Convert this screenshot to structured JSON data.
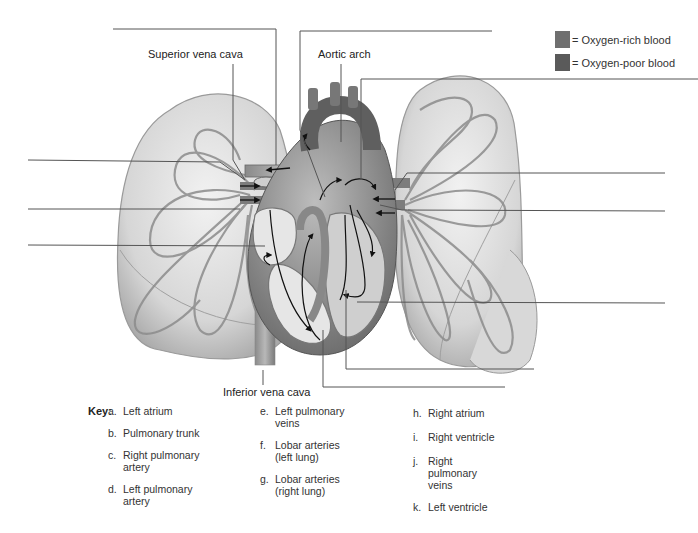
{
  "legend": {
    "items": [
      {
        "label": "= Oxygen-rich blood",
        "color": "#6f6f6f"
      },
      {
        "label": "= Oxygen-poor blood",
        "color": "#5a5a5a"
      }
    ]
  },
  "labels": {
    "superior_vena_cava": "Superior vena cava",
    "aortic_arch": "Aortic arch",
    "inferior_vena_cava": "Inferior vena cava"
  },
  "key": {
    "title": "Key:",
    "columns": [
      [
        {
          "letter": "a.",
          "text": "Left atrium"
        },
        {
          "letter": "b.",
          "text": "Pulmonary trunk"
        },
        {
          "letter": "c.",
          "text": "Right pulmonary artery"
        },
        {
          "letter": "d.",
          "text": "Left pulmonary artery"
        }
      ],
      [
        {
          "letter": "e.",
          "text": "Left pulmonary veins"
        },
        {
          "letter": "f.",
          "text": "Lobar arteries (left lung)"
        },
        {
          "letter": "g.",
          "text": "Lobar arteries (right lung)"
        }
      ],
      [
        {
          "letter": "h.",
          "text": "Right atrium"
        },
        {
          "letter": "i.",
          "text": "Right ventricle"
        },
        {
          "letter": "j.",
          "text": "Right pulmonary veins"
        },
        {
          "letter": "k.",
          "text": "Left ventricle"
        }
      ]
    ]
  },
  "blank_answer_lines": 11
}
